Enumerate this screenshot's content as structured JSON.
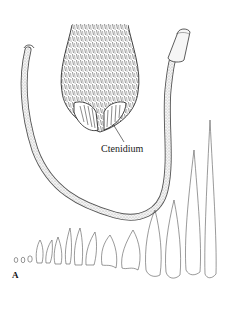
{
  "figure": {
    "panel_label": "A",
    "annotations": [
      {
        "text": "Ctenidium",
        "points_to": "ctenidium-comb-structure"
      }
    ],
    "parts": [
      "elongated-tubular-body",
      "hairy-head-with-ctenidium",
      "graduated-spine-series"
    ],
    "spine_series_count": 15,
    "colors": {
      "background": "#ffffff",
      "ink": "#1a1a1a",
      "stipple": "#8a8a8a"
    }
  }
}
